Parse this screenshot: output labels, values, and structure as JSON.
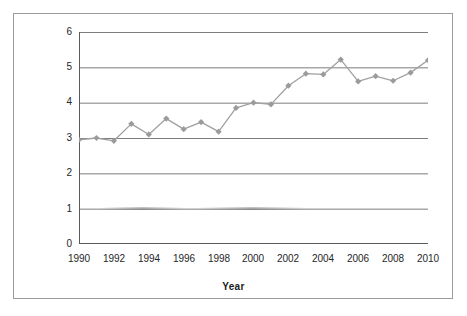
{
  "chart_data": {
    "type": "line",
    "title": "",
    "xlabel": "Year",
    "ylabel": "Percentage of articles",
    "x": [
      1990,
      1991,
      1992,
      1993,
      1994,
      1995,
      1996,
      1997,
      1998,
      1999,
      2000,
      2001,
      2002,
      2003,
      2004,
      2005,
      2006,
      2007,
      2008,
      2009,
      2010
    ],
    "values": [
      2.95,
      3.0,
      2.92,
      3.4,
      3.1,
      3.55,
      3.25,
      3.45,
      3.18,
      3.85,
      4.0,
      3.95,
      4.48,
      4.82,
      4.8,
      5.22,
      4.6,
      4.75,
      4.62,
      4.85,
      5.2
    ],
    "series": [
      {
        "name": "Percentage of articles",
        "values": [
          2.95,
          3.0,
          2.92,
          3.4,
          3.1,
          3.55,
          3.25,
          3.45,
          3.18,
          3.85,
          4.0,
          3.95,
          4.48,
          4.82,
          4.8,
          5.22,
          4.6,
          4.75,
          4.62,
          4.85,
          5.2
        ]
      }
    ],
    "xlim": [
      1990,
      2010
    ],
    "ylim": [
      0,
      6
    ],
    "ytick_labels": [
      "0",
      "1",
      "2",
      "3",
      "4",
      "5",
      "6"
    ],
    "ytick_values": [
      0,
      1,
      2,
      3,
      4,
      5,
      6
    ],
    "xtick_labels": [
      "1990",
      "1992",
      "1994",
      "1996",
      "1998",
      "2000",
      "2002",
      "2004",
      "2006",
      "2008",
      "2010"
    ],
    "xtick_values": [
      1990,
      1992,
      1994,
      1996,
      1998,
      2000,
      2002,
      2004,
      2006,
      2008,
      2010
    ],
    "grid": "horizontal",
    "legend": "none",
    "marker": "diamond",
    "colors": {
      "line": "#a0a0a0",
      "marker": "#9b9b9b",
      "grid": "#7d7d7d",
      "axis": "#5a5a5a",
      "frame": "#9a9a9a",
      "text": "#262626",
      "background": "#ffffff"
    }
  }
}
